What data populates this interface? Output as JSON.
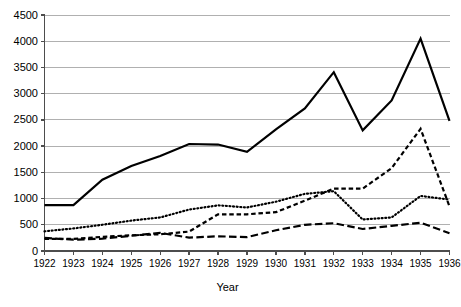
{
  "chart_data": {
    "type": "line",
    "title": "",
    "xlabel": "Year",
    "ylabel": "",
    "grid": true,
    "legend": "none",
    "categories": [
      "1922",
      "1923",
      "1924",
      "1925",
      "1926",
      "1927",
      "1928",
      "1929",
      "1930",
      "1931",
      "1932",
      "1933",
      "1934",
      "1935",
      "1936"
    ],
    "x": [
      1922,
      1923,
      1924,
      1925,
      1926,
      1927,
      1928,
      1929,
      1930,
      1931,
      1932,
      1933,
      1934,
      1935,
      1936
    ],
    "xlim": [
      1922,
      1936
    ],
    "ylim": [
      0,
      4500
    ],
    "ytick_labels": [
      "0",
      "500",
      "1000",
      "1500",
      "2000",
      "2500",
      "3000",
      "3500",
      "4000",
      "4500"
    ],
    "yticks": [
      0,
      500,
      1000,
      1500,
      2000,
      2500,
      3000,
      3500,
      4000,
      4500
    ],
    "series": [
      {
        "name": "series-solid",
        "style": "solid",
        "color": "#000000",
        "width": 2.2,
        "values": [
          875,
          875,
          1360,
          1620,
          1810,
          2040,
          2030,
          1890,
          2320,
          2720,
          3410,
          2300,
          2870,
          4050,
          2480
        ]
      },
      {
        "name": "series-dotted",
        "style": "dotted",
        "color": "#000000",
        "width": 2.2,
        "values": [
          375,
          430,
          500,
          580,
          640,
          790,
          870,
          830,
          940,
          1090,
          1140,
          600,
          640,
          1050,
          980
        ]
      },
      {
        "name": "series-dashed-medium",
        "style": "dashed-medium",
        "color": "#000000",
        "width": 2.2,
        "values": [
          230,
          230,
          270,
          300,
          320,
          370,
          700,
          700,
          740,
          960,
          1190,
          1190,
          1580,
          2330,
          850
        ]
      },
      {
        "name": "series-dashed-long",
        "style": "dashed-long",
        "color": "#000000",
        "width": 2.2,
        "values": [
          250,
          215,
          235,
          290,
          345,
          255,
          280,
          265,
          395,
          500,
          530,
          420,
          480,
          540,
          340
        ]
      }
    ]
  },
  "axes": {
    "x_title": "Year"
  },
  "colors": {
    "grid": "#b0b0b0",
    "axis": "#4d4d4d",
    "line": "#000000",
    "background": "#ffffff"
  }
}
